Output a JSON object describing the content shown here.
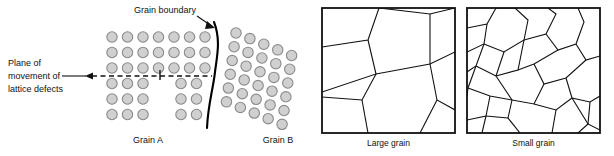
{
  "figure": {
    "background": "#ffffff",
    "atom_fill": "#d0d0d0",
    "atom_stroke": "#8a8a8a",
    "line_color": "#111111",
    "boundary_color": "#000000"
  },
  "left_panel": {
    "name": "grain-boundary-atomic-diagram",
    "labels": {
      "grain_boundary": "Grain boundary",
      "plane_line1": "Plane of",
      "plane_line2": "movement of",
      "plane_line3": "lattice defects",
      "grain_a": "Grain A",
      "grain_b": "Grain B"
    },
    "grain_a": {
      "rows_continuous": 3,
      "rows_offset": 3,
      "columns": 7,
      "spacing_x": 15.5,
      "spacing_y": 15.5,
      "origin_x": 112,
      "origin_y": 37,
      "radius": 5.2,
      "gap_after_column": 3,
      "gap_extra": 7
    },
    "grain_b": {
      "rotation_deg": 22,
      "rows": 6,
      "columns": 5,
      "spacing": 15.0,
      "origin_x": 236,
      "origin_y": 33,
      "radius": 5.2
    },
    "slip_plane": {
      "y": 76,
      "x_start": 86,
      "x_end": 212,
      "dash": "5,3.5",
      "tick_x": 160,
      "tick_top": 70,
      "tick_bottom": 80
    },
    "boundary_path": "M 214 22 C 221 40, 217 56, 215 72 C 213 90, 208 104, 207 128",
    "boundary_leader": "M 197 16 L 213 27"
  },
  "right_panels": [
    {
      "name": "large-grain-panel",
      "caption": "Large grain",
      "box": {
        "x": 322,
        "y": 8,
        "w": 133,
        "h": 125
      },
      "edges": [
        "M 322 47 L 368 40 L 379 8",
        "M 368 40 L 376 74 L 322 92",
        "M 376 74 L 430 64 L 455 52",
        "M 430 64 L 437 100 L 455 110",
        "M 437 100 L 420 133",
        "M 376 74 L 362 100 L 322 97",
        "M 362 100 L 368 133",
        "M 379 8 L 430 14 L 455 8",
        "M 430 14 L 430 64"
      ]
    },
    {
      "name": "small-grain-panel",
      "caption": "Small grain",
      "box": {
        "x": 467,
        "y": 8,
        "w": 133,
        "h": 125
      },
      "edges": [
        "M 467 28 L 487 24 L 496 8",
        "M 487 24 L 484 44 L 467 52",
        "M 484 44 L 504 52 L 524 40 L 528 20 L 515 8",
        "M 496 8 L 515 8",
        "M 524 40 L 546 34 L 556 14 L 548 8",
        "M 546 34 L 558 50 L 576 44 L 584 22 L 578 8",
        "M 576 44 L 586 60 L 600 56",
        "M 484 44 L 476 66 L 467 72",
        "M 476 66 L 496 76 L 504 52",
        "M 496 76 L 518 70 L 524 40",
        "M 518 70 L 534 64 L 558 50",
        "M 534 64 L 544 84 L 566 78 L 586 60",
        "M 544 84 L 534 104 L 512 100",
        "M 566 78 L 572 98 L 590 102 L 600 96",
        "M 512 100 L 496 76",
        "M 512 100 L 508 118 L 520 133",
        "M 534 104 L 556 110 L 572 98",
        "M 556 110 L 552 133",
        "M 476 66 L 468 88 L 467 96",
        "M 468 88 L 490 96 L 512 100",
        "M 490 96 L 486 116 L 467 120",
        "M 486 116 L 508 118",
        "M 486 116 L 482 133",
        "M 590 102 L 588 124 L 600 130",
        "M 588 124 L 572 98",
        "M 588 124 L 578 133"
      ]
    }
  ]
}
